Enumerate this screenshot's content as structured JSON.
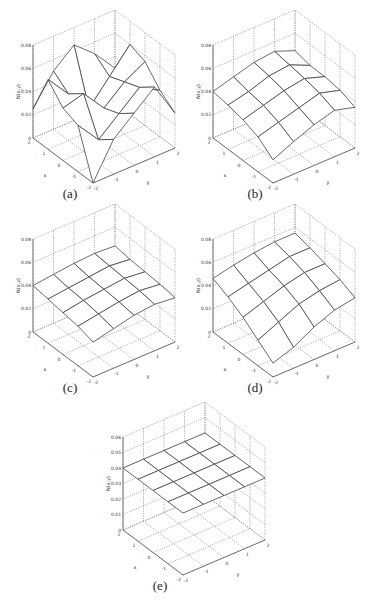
{
  "chart_data": [
    {
      "id": "a",
      "type": "surface3d",
      "caption": "(a)",
      "xlabel": "x",
      "ylabel": "y",
      "zlabel": "N(x,y)",
      "x_ticks": [
        "-2",
        "-1",
        "0",
        "1",
        "2"
      ],
      "y_ticks": [
        "-2",
        "-1",
        "0",
        "1",
        "2"
      ],
      "z_ticks": [
        "0",
        "0.02",
        "0.04",
        "0.06",
        "0.08"
      ],
      "zlim": [
        0,
        0.08
      ],
      "grid": true,
      "x": [
        -2,
        -1,
        0,
        1,
        2
      ],
      "y": [
        -2,
        -1,
        0,
        1,
        2
      ],
      "z": [
        [
          0.0,
          0.03,
          0.045,
          0.06,
          0.03
        ],
        [
          0.04,
          0.02,
          0.035,
          0.05,
          0.04
        ],
        [
          0.045,
          0.05,
          0.03,
          0.045,
          0.055
        ],
        [
          0.06,
          0.04,
          0.02,
          0.04,
          0.06
        ],
        [
          0.025,
          0.05,
          0.065,
          0.05,
          0.03
        ]
      ]
    },
    {
      "id": "b",
      "type": "surface3d",
      "caption": "(b)",
      "xlabel": "x",
      "ylabel": "y",
      "zlabel": "N(x,y)",
      "x_ticks": [
        "-2",
        "-1",
        "0",
        "1",
        "2"
      ],
      "y_ticks": [
        "-2",
        "-1",
        "0",
        "1",
        "2"
      ],
      "z_ticks": [
        "0",
        "0.02",
        "0.04",
        "0.06",
        "0.08"
      ],
      "zlim": [
        0,
        0.08
      ],
      "grid": true,
      "x": [
        -2,
        -1,
        0,
        1,
        2
      ],
      "y": [
        -2,
        -1,
        0,
        1,
        2
      ],
      "z": [
        [
          0.02,
          0.028,
          0.035,
          0.04,
          0.035
        ],
        [
          0.03,
          0.035,
          0.04,
          0.045,
          0.04
        ],
        [
          0.035,
          0.04,
          0.045,
          0.048,
          0.042
        ],
        [
          0.038,
          0.042,
          0.048,
          0.05,
          0.042
        ],
        [
          0.04,
          0.045,
          0.05,
          0.052,
          0.045
        ]
      ]
    },
    {
      "id": "c",
      "type": "surface3d",
      "caption": "(c)",
      "xlabel": "x",
      "ylabel": "y",
      "zlabel": "N(x,y)",
      "x_ticks": [
        "-2",
        "-1",
        "0",
        "1",
        "2"
      ],
      "y_ticks": [
        "-2",
        "-1",
        "0",
        "1",
        "2"
      ],
      "z_ticks": [
        "0",
        "0.02",
        "0.04",
        "0.06",
        "0.08"
      ],
      "zlim": [
        0,
        0.08
      ],
      "grid": true,
      "x": [
        -2,
        -1,
        0,
        1,
        2
      ],
      "y": [
        -2,
        -1,
        0,
        1,
        2
      ],
      "z": [
        [
          0.03,
          0.034,
          0.038,
          0.04,
          0.038
        ],
        [
          0.034,
          0.037,
          0.04,
          0.042,
          0.04
        ],
        [
          0.036,
          0.039,
          0.041,
          0.043,
          0.041
        ],
        [
          0.038,
          0.04,
          0.042,
          0.044,
          0.042
        ],
        [
          0.04,
          0.042,
          0.044,
          0.045,
          0.044
        ]
      ]
    },
    {
      "id": "d",
      "type": "surface3d",
      "caption": "(d)",
      "xlabel": "x",
      "ylabel": "y",
      "zlabel": "N(x,y)",
      "x_ticks": [
        "-2",
        "-1",
        "0",
        "1",
        "2"
      ],
      "y_ticks": [
        "-2",
        "-1",
        "0",
        "1",
        "2"
      ],
      "z_ticks": [
        "0",
        "0.02",
        "0.04",
        "0.06",
        "0.08"
      ],
      "zlim": [
        0,
        0.08
      ],
      "grid": true,
      "x": [
        -2,
        -1,
        0,
        1,
        2
      ],
      "y": [
        -2,
        -1,
        0,
        1,
        2
      ],
      "z": [
        [
          0.012,
          0.018,
          0.028,
          0.035,
          0.038
        ],
        [
          0.022,
          0.03,
          0.038,
          0.042,
          0.044
        ],
        [
          0.032,
          0.038,
          0.044,
          0.048,
          0.048
        ],
        [
          0.04,
          0.044,
          0.048,
          0.052,
          0.052
        ],
        [
          0.046,
          0.05,
          0.053,
          0.055,
          0.055
        ]
      ]
    },
    {
      "id": "e",
      "type": "surface3d",
      "caption": "(e)",
      "xlabel": "x",
      "ylabel": "y",
      "zlabel": "N(x,y)",
      "x_ticks": [
        "-2",
        "-1",
        "0",
        "1",
        "2"
      ],
      "y_ticks": [
        "-2",
        "-1",
        "0",
        "1",
        "2"
      ],
      "z_ticks": [
        "0",
        "0.01",
        "0.02",
        "0.03",
        "0.04",
        "0.05",
        "0.06"
      ],
      "zlim": [
        0,
        0.06
      ],
      "grid": true,
      "x": [
        -2,
        -1,
        0,
        1,
        2
      ],
      "y": [
        -2,
        -1,
        0,
        1,
        2
      ],
      "z": [
        [
          0.04,
          0.04,
          0.04,
          0.04,
          0.04
        ],
        [
          0.04,
          0.04,
          0.04,
          0.04,
          0.04
        ],
        [
          0.04,
          0.04,
          0.04,
          0.04,
          0.04
        ],
        [
          0.04,
          0.04,
          0.04,
          0.04,
          0.04
        ],
        [
          0.04,
          0.04,
          0.04,
          0.04,
          0.04
        ]
      ]
    }
  ],
  "layout": {
    "panels": [
      {
        "left": 20,
        "top": 18
      },
      {
        "left": 200,
        "top": 18
      },
      {
        "left": 20,
        "top": 212
      },
      {
        "left": 200,
        "top": 212
      },
      {
        "left": 110,
        "top": 410
      }
    ],
    "captions": [
      {
        "left": 70,
        "top": 186
      },
      {
        "left": 255,
        "top": 186
      },
      {
        "left": 70,
        "top": 380
      },
      {
        "left": 255,
        "top": 380
      },
      {
        "left": 160,
        "top": 578
      }
    ]
  },
  "colors": {
    "surface_line": "#444444",
    "surface_fill": "#ffffff",
    "grid": "#666666",
    "axis": "#555555"
  }
}
